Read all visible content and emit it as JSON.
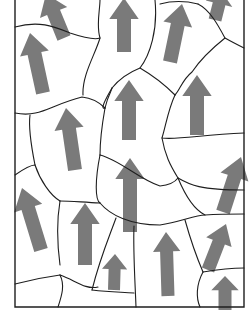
{
  "figure": {
    "colors": {
      "background": "#ffffff",
      "boundary": "#1e1e1e",
      "arrow": "#7a7a7a"
    },
    "frame": {
      "left": 15,
      "right": 244,
      "bottom": 307
    },
    "boundaries": [
      "M15,27 C40,20 55,27 70,33 C85,38 95,40 100,38",
      "M100,0 C100,10 96,25 100,38 C95,55 82,75 83,95",
      "M15,113 C40,118 50,105 82,97 C92,98 100,103 105,108",
      "M155,0 C158,30 150,55 140,68 C130,72 120,78 112,88",
      "M105,108 C108,95 112,90 112,88",
      "M112,88 C105,100 100,110 105,108",
      "M160,4 C175,0 190,2 198,4",
      "M198,4 C210,10 218,25 225,38 C232,42 238,45 244,48",
      "M225,38 C210,50 200,60 192,72 C182,80 180,90 175,95",
      "M140,68 C152,75 165,85 175,95",
      "M175,95 C168,110 166,125 162,138 C178,140 200,135 244,133",
      "M105,108 C102,125 100,140 100,155",
      "M100,155 C120,160 140,180 160,186 C170,185 175,182 178,178",
      "M162,138 C165,155 170,165 178,178 C190,185 200,190 244,190",
      "M15,175 C25,168 30,165 35,165",
      "M35,165 C32,150 28,130 30,115",
      "M35,165 C40,180 50,195 60,201",
      "M60,201 C70,201 80,202 100,203",
      "M100,155 C95,180 95,200 100,203",
      "M178,178 C185,195 195,210 205,215 C220,214 235,214 244,214",
      "M100,203 C110,215 130,225 160,225 C180,222 195,215 205,215",
      "M60,201 C56,225 58,250 60,265",
      "M116,218 C108,240 100,258 92,290",
      "M134,226 C133,250 135,280 136,307",
      "M185,220 C192,245 200,265 203,272",
      "M15,284 C30,280 45,277 60,275",
      "M60,275 C75,280 85,290 98,287",
      "M60,275 C65,285 62,295 58,307",
      "M92,290 C110,292 120,292 134,293",
      "M203,272 C215,270 230,268 244,268",
      "M203,272 C196,285 196,298 200,307"
    ],
    "arrows": [
      {
        "id": 1,
        "tail": [
          64,
          38
        ],
        "tip": [
          46,
          -6
        ],
        "width": 14
      },
      {
        "id": 2,
        "tail": [
          43,
          93
        ],
        "tip": [
          30,
          33
        ],
        "width": 14
      },
      {
        "id": 3,
        "tail": [
          124,
          52
        ],
        "tip": [
          124,
          -2
        ],
        "width": 14
      },
      {
        "id": 4,
        "tail": [
          170,
          62
        ],
        "tip": [
          182,
          4
        ],
        "width": 14
      },
      {
        "id": 5,
        "tail": [
          215,
          20
        ],
        "tip": [
          222,
          -8
        ],
        "width": 13
      },
      {
        "id": 6,
        "tail": [
          129,
          140
        ],
        "tip": [
          129,
          80
        ],
        "width": 14
      },
      {
        "id": 7,
        "tail": [
          197,
          135
        ],
        "tip": [
          197,
          75
        ],
        "width": 14
      },
      {
        "id": 8,
        "tail": [
          75,
          170
        ],
        "tip": [
          66,
          108
        ],
        "width": 14
      },
      {
        "id": 9,
        "tail": [
          130,
          232
        ],
        "tip": [
          130,
          158
        ],
        "width": 14
      },
      {
        "id": 10,
        "tail": [
          223,
          212
        ],
        "tip": [
          241,
          157
        ],
        "width": 14
      },
      {
        "id": 11,
        "tail": [
          41,
          250
        ],
        "tip": [
          22,
          188
        ],
        "width": 14
      },
      {
        "id": 12,
        "tail": [
          85,
          265
        ],
        "tip": [
          85,
          203
        ],
        "width": 14
      },
      {
        "id": 13,
        "tail": [
          168,
          296
        ],
        "tip": [
          166,
          232
        ],
        "width": 13
      },
      {
        "id": 14,
        "tail": [
          208,
          270
        ],
        "tip": [
          226,
          224
        ],
        "width": 13
      },
      {
        "id": 15,
        "tail": [
          114,
          290
        ],
        "tip": [
          115,
          254
        ],
        "width": 12
      },
      {
        "id": 16,
        "tail": [
          225,
          310
        ],
        "tip": [
          225,
          276
        ],
        "width": 13
      }
    ]
  }
}
